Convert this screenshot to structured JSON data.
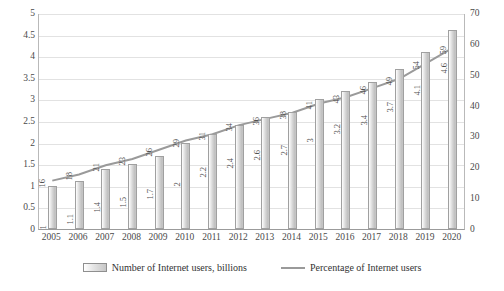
{
  "chart_data": {
    "type": "bar",
    "title": "",
    "xlabel": "",
    "ylabel": "",
    "grid": true,
    "legend_position": "bottom",
    "categories": [
      "2005",
      "2006",
      "2007",
      "2008",
      "2009",
      "2010",
      "2011",
      "2012",
      "2013",
      "2014",
      "2015",
      "2016",
      "2017",
      "2018",
      "2019",
      "2020"
    ],
    "axes": {
      "left": {
        "label": "",
        "ylim": [
          0,
          5
        ],
        "ticks": [
          "0",
          "0.5",
          "1",
          "1.5",
          "2",
          "2.5",
          "3",
          "3.5",
          "4",
          "4.5",
          "5"
        ],
        "tick_values": [
          0,
          0.5,
          1,
          1.5,
          2,
          2.5,
          3,
          3.5,
          4,
          4.5,
          5
        ]
      },
      "right": {
        "label": "",
        "ylim": [
          0,
          70
        ],
        "ticks": [
          "0",
          "10",
          "20",
          "30",
          "40",
          "50",
          "60",
          "70"
        ],
        "tick_values": [
          0,
          10,
          20,
          30,
          40,
          50,
          60,
          70
        ]
      }
    },
    "series": [
      {
        "name": "Number of Internet users, billions",
        "type": "bar",
        "axis": "left",
        "color": "#c8c8c8",
        "values": [
          1,
          1.1,
          1.4,
          1.5,
          1.7,
          2,
          2.2,
          2.4,
          2.6,
          2.7,
          3,
          3.2,
          3.4,
          3.7,
          4.1,
          4.6
        ],
        "labels": [
          "1",
          "1.1",
          "1.4",
          "1.5",
          "1.7",
          "2",
          "2.2",
          "2.4",
          "2.6",
          "2.7",
          "3",
          "3.2",
          "3.4",
          "3.7",
          "4.1",
          "4.6"
        ]
      },
      {
        "name": "Percentage of Internet users",
        "type": "line",
        "axis": "right",
        "color": "#9a9a9a",
        "values": [
          16,
          18,
          21,
          23,
          26,
          29,
          31,
          34,
          36,
          38,
          41,
          43,
          46,
          49,
          54,
          59
        ],
        "labels": [
          "16",
          "18",
          "21",
          "23",
          "26",
          "29",
          "31",
          "34",
          "36",
          "38",
          "41",
          "43",
          "46",
          "49",
          "54",
          "59"
        ]
      }
    ]
  },
  "legend": {
    "items": [
      {
        "label": "Number of Internet users, billions",
        "marker": "bar-swatch"
      },
      {
        "label": "Percentage of Internet users",
        "marker": "line-swatch"
      }
    ]
  }
}
